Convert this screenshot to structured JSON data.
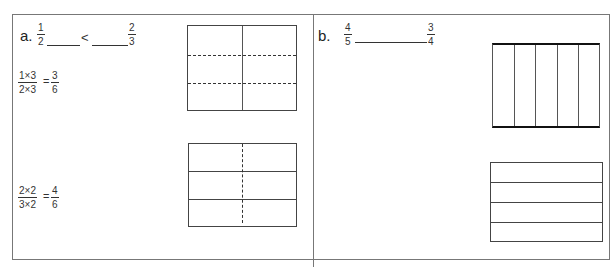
{
  "part_a": {
    "label": "a.",
    "comparison": {
      "left": {
        "num": "1",
        "den": "2"
      },
      "symbol": "<",
      "right": {
        "num": "2",
        "den": "3"
      }
    },
    "equation1": {
      "lhs": {
        "num": "1×3",
        "den": "2×3"
      },
      "eq": "=",
      "rhs": {
        "num": "3",
        "den": "6"
      }
    },
    "equation2": {
      "lhs": {
        "num": "2×2",
        "den": "3×2"
      },
      "eq": "=",
      "rhs": {
        "num": "4",
        "den": "6"
      }
    },
    "model1": {
      "description": "rectangle split into 2 columns (solid) and 3 rows (dashed)",
      "columns": 2,
      "rows": 3
    },
    "model2": {
      "description": "rectangle split into 3 rows (solid) and 2 columns (dashed)",
      "columns": 2,
      "rows": 3
    }
  },
  "part_b": {
    "label": "b.",
    "comparison": {
      "left": {
        "num": "4",
        "den": "5"
      },
      "symbol": "",
      "right": {
        "num": "3",
        "den": "4"
      }
    },
    "model1": {
      "description": "rectangle split into 5 columns",
      "columns": 5
    },
    "model2": {
      "description": "rectangle split into 4 rows",
      "rows": 4
    }
  }
}
